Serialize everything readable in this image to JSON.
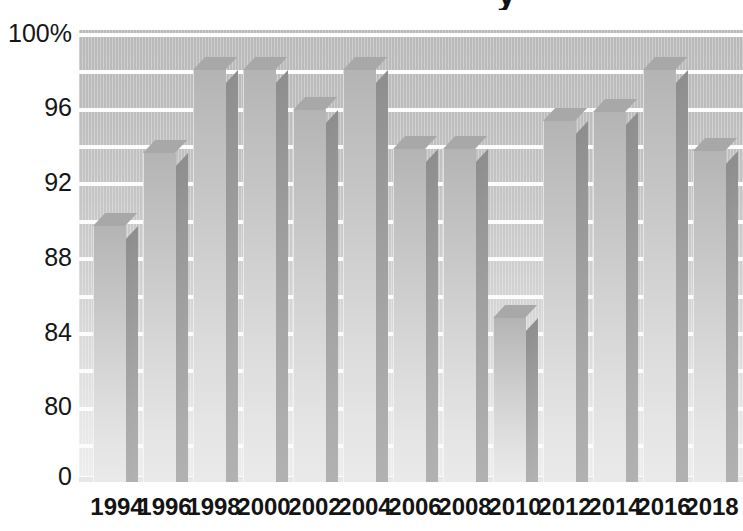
{
  "chart_data": {
    "type": "bar",
    "title": "",
    "xlabel": "",
    "ylabel": "",
    "categories": [
      "1994",
      "1996",
      "1998",
      "2000",
      "2002",
      "2004",
      "2006",
      "2008",
      "2010",
      "2012",
      "2014",
      "2016",
      "2018"
    ],
    "values": [
      89.0,
      92.9,
      97.3,
      97.3,
      95.2,
      97.3,
      93.1,
      93.1,
      84.1,
      94.6,
      95.1,
      97.3,
      93.0
    ],
    "series": [
      {
        "name": "Percent",
        "values": [
          89.0,
          92.9,
          97.3,
          97.3,
          95.2,
          97.3,
          93.1,
          93.1,
          84.1,
          94.6,
          95.1,
          97.3,
          93.0
        ]
      }
    ],
    "ytick_labels": [
      "100%",
      "96",
      "92",
      "88",
      "84",
      "80",
      "0"
    ],
    "ytick_values": [
      100,
      96,
      92,
      88,
      84,
      80,
      0
    ],
    "ylim": [
      78.2,
      100
    ],
    "yaxis_break": true,
    "grid": true,
    "legend": false,
    "legend_position": "none",
    "style": "3d-bar",
    "annotations": []
  },
  "axes": {
    "y_ticks": [
      {
        "label": "100%",
        "y": 21
      },
      {
        "label": "96",
        "y": 95
      },
      {
        "label": "92",
        "y": 170
      },
      {
        "label": "88",
        "y": 245
      },
      {
        "label": "84",
        "y": 320
      },
      {
        "label": "80",
        "y": 394
      },
      {
        "label": "0",
        "y": 464
      }
    ],
    "x_ticks": [
      {
        "label": "1994",
        "cx": 117
      },
      {
        "label": "1996",
        "cx": 165
      },
      {
        "label": "1998",
        "cx": 214
      },
      {
        "label": "2000",
        "cx": 264
      },
      {
        "label": "2002",
        "cx": 315
      },
      {
        "label": "2004",
        "cx": 365
      },
      {
        "label": "2006",
        "cx": 415
      },
      {
        "label": "2008",
        "cx": 465
      },
      {
        "label": "2010",
        "cx": 515
      },
      {
        "label": "2012",
        "cx": 565
      },
      {
        "label": "2014",
        "cx": 615
      },
      {
        "label": "2016",
        "cx": 664
      },
      {
        "label": "2018",
        "cx": 712
      }
    ]
  },
  "plot": {
    "gridlines": [
      {
        "y": 3,
        "kind": "major"
      },
      {
        "y": 40,
        "kind": "major"
      },
      {
        "y": 78,
        "kind": "major"
      },
      {
        "y": 115,
        "kind": "major"
      },
      {
        "y": 152,
        "kind": "major"
      },
      {
        "y": 190,
        "kind": "major"
      },
      {
        "y": 227,
        "kind": "major"
      },
      {
        "y": 265,
        "kind": "major"
      },
      {
        "y": 302,
        "kind": "major"
      },
      {
        "y": 339,
        "kind": "major"
      },
      {
        "y": 377,
        "kind": "major"
      },
      {
        "y": 414,
        "kind": "major"
      },
      {
        "y": 446,
        "kind": "major"
      }
    ],
    "bars": [
      {
        "label": "1994",
        "value": 89.0,
        "x": 14,
        "w": 32,
        "top": 196
      },
      {
        "label": "1996",
        "value": 92.9,
        "x": 64,
        "w": 32,
        "top": 123
      },
      {
        "label": "1998",
        "value": 97.3,
        "x": 114,
        "w": 32,
        "top": 40
      },
      {
        "label": "2000",
        "value": 97.3,
        "x": 164,
        "w": 32,
        "top": 40
      },
      {
        "label": "2002",
        "value": 95.2,
        "x": 214,
        "w": 32,
        "top": 80
      },
      {
        "label": "2004",
        "value": 97.3,
        "x": 264,
        "w": 32,
        "top": 40
      },
      {
        "label": "2006",
        "value": 93.1,
        "x": 314,
        "w": 32,
        "top": 119
      },
      {
        "label": "2008",
        "value": 93.1,
        "x": 364,
        "w": 32,
        "top": 119
      },
      {
        "label": "2010",
        "value": 84.1,
        "x": 414,
        "w": 32,
        "top": 288
      },
      {
        "label": "2012",
        "value": 94.6,
        "x": 464,
        "w": 32,
        "top": 91
      },
      {
        "label": "2014",
        "value": 95.1,
        "x": 514,
        "w": 32,
        "top": 82
      },
      {
        "label": "2016",
        "value": 97.3,
        "x": 564,
        "w": 32,
        "top": 40
      },
      {
        "label": "2018",
        "value": 93.0,
        "x": 614,
        "w": 32,
        "top": 121
      }
    ]
  },
  "title_remnant": {
    "text": "y"
  },
  "colors": {
    "bar_front_light": "#eaeaea",
    "bar_front_dark": "#b4b4b4",
    "bar_side": "#a0a0a0",
    "bar_top": "#a8a8a8",
    "plot_bg_top": "#b9b9b9",
    "plot_bg_bottom": "#ededed",
    "gridline": "#fcfcfc",
    "text": "#141414",
    "page_bg": "#ffffff"
  }
}
